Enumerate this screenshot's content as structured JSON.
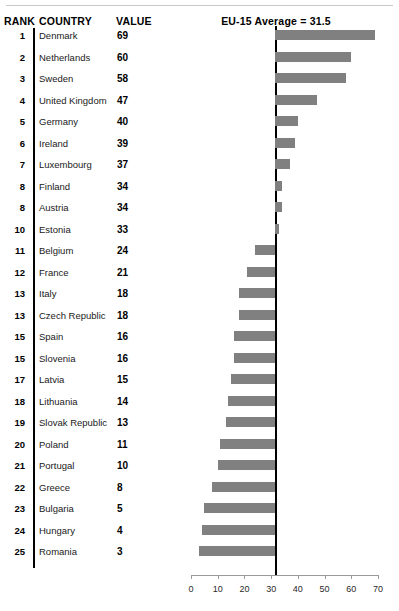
{
  "header": {
    "rank_label": "RANK",
    "country_label": "COUNTRY",
    "value_label": "VALUE",
    "average_label": "EU-15 Average = 31.5"
  },
  "style": {
    "bar_color": "#808080",
    "axis_color": "#9a9a9a",
    "line_color": "#000000",
    "rule_color": "#c9c9c9"
  },
  "chart_data": {
    "type": "bar",
    "title": "EU-15 Average = 31.5",
    "xlabel": "",
    "ylabel": "",
    "orientation": "horizontal",
    "xlim": [
      0,
      70
    ],
    "xticks": [
      0,
      10,
      20,
      30,
      40,
      50,
      60,
      70
    ],
    "xtick_labels": [
      "0",
      "10",
      "20",
      "30",
      "40",
      "50",
      "60",
      "70"
    ],
    "grid": false,
    "legend": null,
    "reference_line": {
      "label": "EU-15 Average = 31.5",
      "value": 31.5
    },
    "baseline": 31.5,
    "columns": [
      "RANK",
      "COUNTRY",
      "VALUE"
    ],
    "categories": [
      "Denmark",
      "Netherlands",
      "Sweden",
      "United Kingdom",
      "Germany",
      "Ireland",
      "Luxembourg",
      "Finland",
      "Austria",
      "Estonia",
      "Belgium",
      "France",
      "Italy",
      "Czech Republic",
      "Spain",
      "Slovenia",
      "Latvia",
      "Lithuania",
      "Slovak Republic",
      "Poland",
      "Portugal",
      "Greece",
      "Bulgaria",
      "Hungary",
      "Romania"
    ],
    "values": [
      69,
      60,
      58,
      47,
      40,
      39,
      37,
      34,
      34,
      33,
      24,
      21,
      18,
      18,
      16,
      16,
      15,
      14,
      13,
      11,
      10,
      8,
      5,
      4,
      3
    ],
    "ranks": [
      "1",
      "2",
      "3",
      "4",
      "5",
      "6",
      "7",
      "8",
      "8",
      "10",
      "11",
      "12",
      "13",
      "13",
      "15",
      "15",
      "17",
      "18",
      "19",
      "20",
      "21",
      "22",
      "23",
      "24",
      "25"
    ]
  },
  "rows": [
    {
      "rank": "1",
      "country": "Denmark",
      "value": "69"
    },
    {
      "rank": "2",
      "country": "Netherlands",
      "value": "60"
    },
    {
      "rank": "3",
      "country": "Sweden",
      "value": "58"
    },
    {
      "rank": "4",
      "country": "United Kingdom",
      "value": "47"
    },
    {
      "rank": "5",
      "country": "Germany",
      "value": "40"
    },
    {
      "rank": "6",
      "country": "Ireland",
      "value": "39"
    },
    {
      "rank": "7",
      "country": "Luxembourg",
      "value": "37"
    },
    {
      "rank": "8",
      "country": "Finland",
      "value": "34"
    },
    {
      "rank": "8",
      "country": "Austria",
      "value": "34"
    },
    {
      "rank": "10",
      "country": "Estonia",
      "value": "33"
    },
    {
      "rank": "11",
      "country": "Belgium",
      "value": "24"
    },
    {
      "rank": "12",
      "country": "France",
      "value": "21"
    },
    {
      "rank": "13",
      "country": "Italy",
      "value": "18"
    },
    {
      "rank": "13",
      "country": "Czech Republic",
      "value": "18"
    },
    {
      "rank": "15",
      "country": "Spain",
      "value": "16"
    },
    {
      "rank": "15",
      "country": "Slovenia",
      "value": "16"
    },
    {
      "rank": "17",
      "country": "Latvia",
      "value": "15"
    },
    {
      "rank": "18",
      "country": "Lithuania",
      "value": "14"
    },
    {
      "rank": "19",
      "country": "Slovak Republic",
      "value": "13"
    },
    {
      "rank": "20",
      "country": "Poland",
      "value": "11"
    },
    {
      "rank": "21",
      "country": "Portugal",
      "value": "10"
    },
    {
      "rank": "22",
      "country": "Greece",
      "value": "8"
    },
    {
      "rank": "23",
      "country": "Bulgaria",
      "value": "5"
    },
    {
      "rank": "24",
      "country": "Hungary",
      "value": "4"
    },
    {
      "rank": "25",
      "country": "Romania",
      "value": "3"
    }
  ],
  "axis": {
    "ticks": [
      "0",
      "10",
      "20",
      "30",
      "40",
      "50",
      "60",
      "70"
    ]
  }
}
